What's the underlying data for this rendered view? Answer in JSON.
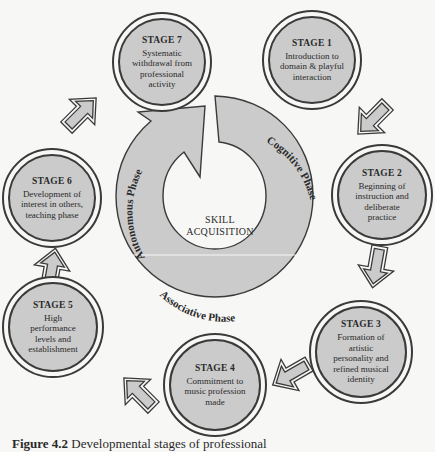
{
  "diagram": {
    "center": {
      "line1": "SKILL",
      "line2": "ACQUISITION"
    },
    "phases": [
      {
        "label": "Cognitive Phase"
      },
      {
        "label": "Associative Phase"
      },
      {
        "label": "Autonomous Phase"
      }
    ],
    "stages": [
      {
        "title": "STAGE 1",
        "desc": [
          "Introduction to",
          "domain & playful",
          "interaction"
        ]
      },
      {
        "title": "STAGE 2",
        "desc": [
          "Beginning of",
          "instruction and",
          "deliberate",
          "practice"
        ]
      },
      {
        "title": "STAGE 3",
        "desc": [
          "Formation of",
          "artistic",
          "personality and",
          "refined musical",
          "identity"
        ]
      },
      {
        "title": "STAGE 4",
        "desc": [
          "Commitment to",
          "music profession",
          "made"
        ]
      },
      {
        "title": "STAGE 5",
        "desc": [
          "High",
          "performance",
          "levels and",
          "establishment"
        ]
      },
      {
        "title": "STAGE 6",
        "desc": [
          "Development of",
          "interest in others,",
          "teaching phase"
        ]
      },
      {
        "title": "STAGE 7",
        "desc": [
          "Systematic",
          "withdrawal from",
          "professional",
          "activity"
        ]
      }
    ],
    "colors": {
      "fill": "#cbcbcb",
      "stroke": "#3a3a3a",
      "background": "#f7f7f5"
    }
  },
  "caption": {
    "label": "Figure 4.2",
    "text": "Developmental stages of professional"
  }
}
